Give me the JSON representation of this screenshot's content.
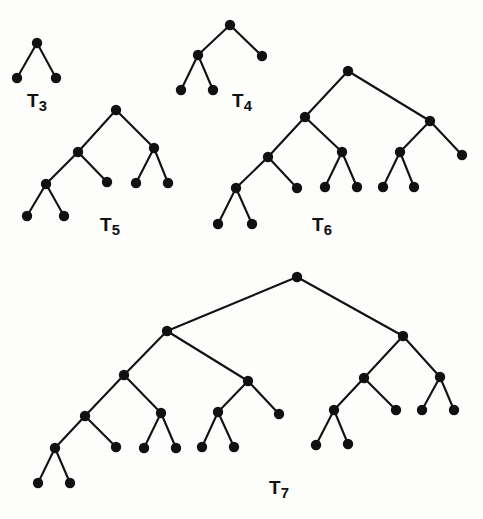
{
  "figure": {
    "width": 483,
    "height": 519,
    "background_color": "#fdfdfc",
    "node_color": "#111111",
    "edge_color": "#111111",
    "node_radius": 5.2,
    "edge_width": 2.1
  },
  "trees": [
    {
      "id": "T3",
      "label_base": "T",
      "label_sub": "3",
      "label_x": 37,
      "label_y": 100,
      "nodes": [
        {
          "id": "t3-n0",
          "x": 37,
          "y": 43
        },
        {
          "id": "t3-n1",
          "x": 17,
          "y": 78
        },
        {
          "id": "t3-n2",
          "x": 56,
          "y": 78
        }
      ],
      "edges": [
        {
          "from": "t3-n0",
          "to": "t3-n1"
        },
        {
          "from": "t3-n0",
          "to": "t3-n2"
        }
      ]
    },
    {
      "id": "T4",
      "label_base": "T",
      "label_sub": "4",
      "label_x": 242,
      "label_y": 100,
      "nodes": [
        {
          "id": "t4-n0",
          "x": 230,
          "y": 25
        },
        {
          "id": "t4-n1",
          "x": 198,
          "y": 55
        },
        {
          "id": "t4-n2",
          "x": 262,
          "y": 56
        },
        {
          "id": "t4-n3",
          "x": 181,
          "y": 90
        },
        {
          "id": "t4-n4",
          "x": 213,
          "y": 90
        }
      ],
      "edges": [
        {
          "from": "t4-n0",
          "to": "t4-n1"
        },
        {
          "from": "t4-n0",
          "to": "t4-n2"
        },
        {
          "from": "t4-n1",
          "to": "t4-n3"
        },
        {
          "from": "t4-n1",
          "to": "t4-n4"
        }
      ]
    },
    {
      "id": "T5",
      "label_base": "T",
      "label_sub": "5",
      "label_x": 110,
      "label_y": 224,
      "nodes": [
        {
          "id": "t5-n0",
          "x": 116,
          "y": 110
        },
        {
          "id": "t5-n1",
          "x": 78,
          "y": 152
        },
        {
          "id": "t5-n2",
          "x": 154,
          "y": 148
        },
        {
          "id": "t5-n3",
          "x": 46,
          "y": 184
        },
        {
          "id": "t5-n4",
          "x": 107,
          "y": 182
        },
        {
          "id": "t5-n5",
          "x": 136,
          "y": 183
        },
        {
          "id": "t5-n6",
          "x": 168,
          "y": 183
        },
        {
          "id": "t5-n7",
          "x": 27,
          "y": 216
        },
        {
          "id": "t5-n8",
          "x": 64,
          "y": 216
        }
      ],
      "edges": [
        {
          "from": "t5-n0",
          "to": "t5-n1"
        },
        {
          "from": "t5-n0",
          "to": "t5-n2"
        },
        {
          "from": "t5-n1",
          "to": "t5-n3"
        },
        {
          "from": "t5-n1",
          "to": "t5-n4"
        },
        {
          "from": "t5-n2",
          "to": "t5-n5"
        },
        {
          "from": "t5-n2",
          "to": "t5-n6"
        },
        {
          "from": "t5-n3",
          "to": "t5-n7"
        },
        {
          "from": "t5-n3",
          "to": "t5-n8"
        }
      ]
    },
    {
      "id": "T6",
      "label_base": "T",
      "label_sub": "6",
      "label_x": 322,
      "label_y": 224,
      "nodes": [
        {
          "id": "t6-n0",
          "x": 348,
          "y": 71
        },
        {
          "id": "t6-n1",
          "x": 305,
          "y": 117
        },
        {
          "id": "t6-n2",
          "x": 430,
          "y": 121
        },
        {
          "id": "t6-n3",
          "x": 268,
          "y": 157
        },
        {
          "id": "t6-n4",
          "x": 342,
          "y": 152
        },
        {
          "id": "t6-n5",
          "x": 400,
          "y": 152
        },
        {
          "id": "t6-n6",
          "x": 462,
          "y": 155
        },
        {
          "id": "t6-n7",
          "x": 236,
          "y": 188
        },
        {
          "id": "t6-n8",
          "x": 297,
          "y": 188
        },
        {
          "id": "t6-n9",
          "x": 325,
          "y": 187
        },
        {
          "id": "t6-n10",
          "x": 357,
          "y": 187
        },
        {
          "id": "t6-n11",
          "x": 383,
          "y": 187
        },
        {
          "id": "t6-n12",
          "x": 414,
          "y": 187
        },
        {
          "id": "t6-n13",
          "x": 218,
          "y": 224
        },
        {
          "id": "t6-n14",
          "x": 252,
          "y": 224
        }
      ],
      "edges": [
        {
          "from": "t6-n0",
          "to": "t6-n1"
        },
        {
          "from": "t6-n0",
          "to": "t6-n2"
        },
        {
          "from": "t6-n1",
          "to": "t6-n3"
        },
        {
          "from": "t6-n1",
          "to": "t6-n4"
        },
        {
          "from": "t6-n2",
          "to": "t6-n5"
        },
        {
          "from": "t6-n2",
          "to": "t6-n6"
        },
        {
          "from": "t6-n3",
          "to": "t6-n7"
        },
        {
          "from": "t6-n3",
          "to": "t6-n8"
        },
        {
          "from": "t6-n4",
          "to": "t6-n9"
        },
        {
          "from": "t6-n4",
          "to": "t6-n10"
        },
        {
          "from": "t6-n5",
          "to": "t6-n11"
        },
        {
          "from": "t6-n5",
          "to": "t6-n12"
        },
        {
          "from": "t6-n7",
          "to": "t6-n13"
        },
        {
          "from": "t6-n7",
          "to": "t6-n14"
        }
      ]
    },
    {
      "id": "T7",
      "label_base": "T",
      "label_sub": "7",
      "label_x": 279,
      "label_y": 487,
      "nodes": [
        {
          "id": "t7-n0",
          "x": 297,
          "y": 277
        },
        {
          "id": "t7-n1",
          "x": 167,
          "y": 331
        },
        {
          "id": "t7-n2",
          "x": 403,
          "y": 336
        },
        {
          "id": "t7-n3",
          "x": 124,
          "y": 375
        },
        {
          "id": "t7-n4",
          "x": 248,
          "y": 381
        },
        {
          "id": "t7-n5",
          "x": 364,
          "y": 378
        },
        {
          "id": "t7-n6",
          "x": 440,
          "y": 377
        },
        {
          "id": "t7-n7",
          "x": 85,
          "y": 416
        },
        {
          "id": "t7-n8",
          "x": 161,
          "y": 413
        },
        {
          "id": "t7-n9",
          "x": 218,
          "y": 412
        },
        {
          "id": "t7-n10",
          "x": 279,
          "y": 414
        },
        {
          "id": "t7-n11",
          "x": 334,
          "y": 410
        },
        {
          "id": "t7-n12",
          "x": 396,
          "y": 410
        },
        {
          "id": "t7-n13",
          "x": 422,
          "y": 410
        },
        {
          "id": "t7-n14",
          "x": 454,
          "y": 410
        },
        {
          "id": "t7-n15",
          "x": 55,
          "y": 448
        },
        {
          "id": "t7-n16",
          "x": 116,
          "y": 447
        },
        {
          "id": "t7-n17",
          "x": 144,
          "y": 448
        },
        {
          "id": "t7-n18",
          "x": 176,
          "y": 448
        },
        {
          "id": "t7-n19",
          "x": 202,
          "y": 447
        },
        {
          "id": "t7-n20",
          "x": 234,
          "y": 447
        },
        {
          "id": "t7-n21",
          "x": 316,
          "y": 445
        },
        {
          "id": "t7-n22",
          "x": 348,
          "y": 444
        },
        {
          "id": "t7-n23",
          "x": 38,
          "y": 483
        },
        {
          "id": "t7-n24",
          "x": 70,
          "y": 483
        }
      ],
      "edges": [
        {
          "from": "t7-n0",
          "to": "t7-n1"
        },
        {
          "from": "t7-n0",
          "to": "t7-n2"
        },
        {
          "from": "t7-n1",
          "to": "t7-n3"
        },
        {
          "from": "t7-n1",
          "to": "t7-n4"
        },
        {
          "from": "t7-n2",
          "to": "t7-n5"
        },
        {
          "from": "t7-n2",
          "to": "t7-n6"
        },
        {
          "from": "t7-n3",
          "to": "t7-n7"
        },
        {
          "from": "t7-n3",
          "to": "t7-n8"
        },
        {
          "from": "t7-n4",
          "to": "t7-n9"
        },
        {
          "from": "t7-n4",
          "to": "t7-n10"
        },
        {
          "from": "t7-n5",
          "to": "t7-n11"
        },
        {
          "from": "t7-n5",
          "to": "t7-n12"
        },
        {
          "from": "t7-n6",
          "to": "t7-n13"
        },
        {
          "from": "t7-n6",
          "to": "t7-n14"
        },
        {
          "from": "t7-n7",
          "to": "t7-n15"
        },
        {
          "from": "t7-n7",
          "to": "t7-n16"
        },
        {
          "from": "t7-n8",
          "to": "t7-n17"
        },
        {
          "from": "t7-n8",
          "to": "t7-n18"
        },
        {
          "from": "t7-n9",
          "to": "t7-n19"
        },
        {
          "from": "t7-n9",
          "to": "t7-n20"
        },
        {
          "from": "t7-n11",
          "to": "t7-n21"
        },
        {
          "from": "t7-n11",
          "to": "t7-n22"
        },
        {
          "from": "t7-n15",
          "to": "t7-n23"
        },
        {
          "from": "t7-n15",
          "to": "t7-n24"
        }
      ]
    }
  ]
}
